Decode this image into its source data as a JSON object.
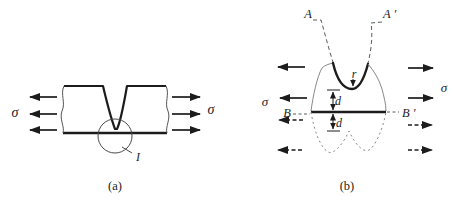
{
  "figure": {
    "colors": {
      "ink": "#1c1c1c",
      "thin_outline": "#888888",
      "dash_gray": "#5a5a5a",
      "background": "#ffffff"
    },
    "panel_a": {
      "caption": "(a)",
      "sigma_left": "σ",
      "sigma_right": "σ",
      "magnified_region_label": "I"
    },
    "panel_b": {
      "caption": "(b)",
      "sigma_left": "σ",
      "sigma_right": "σ",
      "section_a": "A",
      "section_a_prime": "A ′",
      "section_b": "B",
      "section_b_prime": "B ′",
      "radius_label": "r",
      "depth_above_label": "d",
      "depth_below_label": "d"
    }
  }
}
